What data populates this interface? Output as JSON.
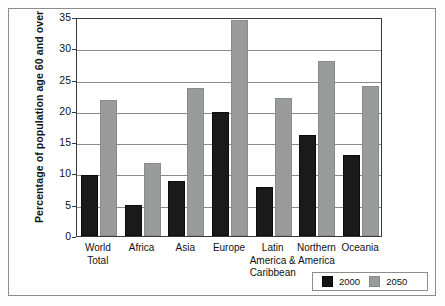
{
  "chart_data": {
    "type": "bar",
    "title": "",
    "xlabel": "",
    "ylabel": "Percentage of population age 60 and over",
    "ylim": [
      0,
      35
    ],
    "ytick_values": [
      0,
      5,
      10,
      15,
      20,
      25,
      30,
      35
    ],
    "ytick_labels": [
      "0",
      "5",
      "10",
      "15",
      "20",
      "25",
      "30",
      "35"
    ],
    "grid": true,
    "legend_position": "bottom-right",
    "categories": [
      "World Total",
      "Africa",
      "Asia",
      "Europe",
      "Latin America & Caribbean",
      "Northern America",
      "Oceania"
    ],
    "category_lines": [
      [
        "World",
        "Total"
      ],
      [
        "Africa"
      ],
      [
        "Asia"
      ],
      [
        "Europe"
      ],
      [
        "Latin",
        "America &",
        "Caribbean"
      ],
      [
        "Northern",
        "America"
      ],
      [
        "Oceania"
      ]
    ],
    "series": [
      {
        "name": "2000",
        "color": "#1a1a1a",
        "values": [
          9.7,
          4.9,
          8.8,
          19.8,
          7.9,
          16.1,
          12.9
        ]
      },
      {
        "name": "2050",
        "color": "#9a9b9b",
        "values": [
          21.7,
          11.6,
          23.7,
          34.6,
          22.0,
          27.9,
          24.0
        ]
      }
    ]
  },
  "legend": {
    "items": [
      {
        "label": "2000",
        "color": "#1a1a1a"
      },
      {
        "label": "2050",
        "color": "#9a9b9b"
      }
    ]
  }
}
